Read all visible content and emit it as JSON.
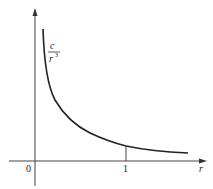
{
  "figure": {
    "curve_label": {
      "numerator": "c",
      "denominator": "r",
      "exponent": "3"
    },
    "origin_label": "0",
    "tick_label": "1",
    "x_axis_label": "r",
    "colors": {
      "ink": "#222222",
      "background": "#ffffff"
    }
  }
}
